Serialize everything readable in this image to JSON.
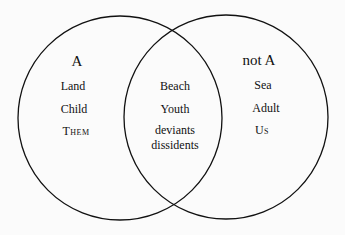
{
  "diagram": {
    "type": "venn",
    "left_set": {
      "title": "A",
      "items": [
        "Land",
        "Child",
        "Them"
      ]
    },
    "right_set": {
      "title": "not A",
      "items": [
        "Sea",
        "Adult",
        "Us"
      ]
    },
    "intersection": {
      "items": [
        "Beach",
        "Youth",
        "deviants",
        "dissidents"
      ]
    },
    "colors": {
      "stroke": "#111111",
      "background": "#fbfbfb"
    }
  }
}
